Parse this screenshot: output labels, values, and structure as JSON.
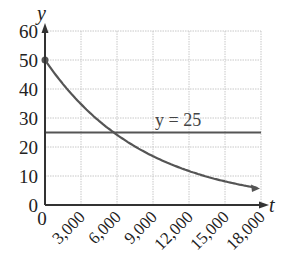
{
  "chart_data": {
    "type": "line",
    "title": "",
    "xlabel": "t",
    "ylabel": "y",
    "xlim": [
      0,
      18000
    ],
    "ylim": [
      0,
      60
    ],
    "grid": true,
    "x_ticks": [
      "0",
      "3,000",
      "6,000",
      "9,000",
      "12,000",
      "15,000",
      "18,000"
    ],
    "y_ticks": [
      "0",
      "10",
      "20",
      "30",
      "40",
      "50",
      "60"
    ],
    "series": [
      {
        "name": "decay curve",
        "x": [
          0,
          3000,
          5730,
          6000,
          9000,
          12000,
          15000,
          18000
        ],
        "values": [
          50,
          34.8,
          25,
          24.2,
          16.9,
          11.7,
          8.2,
          5.7
        ]
      },
      {
        "name": "y = 25",
        "x": [
          0,
          18000
        ],
        "values": [
          25,
          25
        ]
      }
    ],
    "annotations": [
      {
        "text": "y = 25",
        "x": 12000,
        "y": 27
      }
    ],
    "legend": "none"
  },
  "labels": {
    "x_axis": "t",
    "y_axis": "y",
    "line_annotation": "y = 25"
  }
}
